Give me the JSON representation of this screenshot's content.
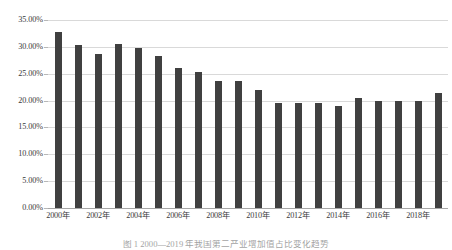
{
  "chart_data": {
    "type": "bar",
    "title": "",
    "xlabel": "",
    "ylabel": "",
    "ylim": [
      0,
      35
    ],
    "ytick_values": [
      0,
      5,
      10,
      15,
      20,
      25,
      30,
      35
    ],
    "ytick_labels": [
      "0.00%",
      "5.00%",
      "10.00%",
      "15.00%",
      "20.00%",
      "25.00%",
      "30.00%",
      "35.00%"
    ],
    "grid": true,
    "legend": "none",
    "bar_color": "#404040",
    "gridline_color": "#d9d9d9",
    "categories": [
      "2000年",
      "2001年",
      "2002年",
      "2003年",
      "2004年",
      "2005年",
      "2006年",
      "2007年",
      "2008年",
      "2009年",
      "2010年",
      "2011年",
      "2012年",
      "2013年",
      "2014年",
      "2015年",
      "2016年",
      "2017年",
      "2018年",
      "2019年"
    ],
    "xtick_labels_shown": [
      "2000年",
      "2002年",
      "2004年",
      "2006年",
      "2008年",
      "2010年",
      "2012年",
      "2014年",
      "2016年",
      "2018年"
    ],
    "values": [
      32.7,
      30.3,
      28.6,
      30.5,
      29.8,
      28.3,
      26.0,
      25.3,
      23.7,
      23.6,
      21.9,
      19.6,
      19.5,
      19.5,
      18.9,
      20.4,
      20.0,
      19.9,
      20.0,
      21.5
    ]
  },
  "caption": {
    "text": "图 1  2000—2019 年我国第二产业增加值占比变化趋势"
  }
}
